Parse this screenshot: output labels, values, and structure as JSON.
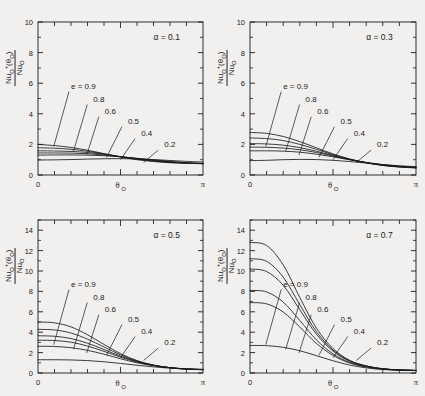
{
  "figure": {
    "caption_present": false,
    "background": "#f2f0ee",
    "ink": "#1a1a1a",
    "panel_count": 4
  },
  "axis": {
    "xlabel": "θ",
    "xlabel_sub": "O",
    "x_tick_left": "0",
    "x_tick_right": "π",
    "ylabel_num_pre": "Nu",
    "ylabel_num_sub": "O",
    "ylabel_num_sup": "+",
    "ylabel_num_arg": "(θ",
    "ylabel_num_arg_sub": "O",
    "ylabel_num_arg_post": ")",
    "ylabel_den_pre": "Nu",
    "ylabel_den_sub": "O"
  },
  "series_labels": {
    "first": "e = 0.9",
    "rest": [
      "0.8",
      "0.6",
      "0.5",
      "0.4",
      "0.2"
    ],
    "all": [
      "e = 0.9",
      "0.8",
      "0.6",
      "0.5",
      "0.4",
      "0.2"
    ],
    "e_values": [
      0.9,
      0.8,
      0.6,
      0.5,
      0.4,
      0.2
    ]
  },
  "chart_data": [
    {
      "type": "line",
      "panel": "top-left",
      "title": "α = 0.1",
      "annotation": "α = 0.1",
      "alpha": 0.1,
      "xlabel": "θO",
      "ylabel": "NuO+(θO) / NuO",
      "xlim": [
        0,
        3.14159
      ],
      "ylim": [
        0,
        10
      ],
      "xticks_major": [
        0,
        3.14159
      ],
      "xtick_labels": [
        "0",
        "π"
      ],
      "xticks_minor_count": 10,
      "yticks": [
        0,
        2,
        4,
        6,
        8,
        10
      ],
      "ytick_labels": [
        "0",
        "2",
        "4",
        "6",
        "8",
        "10"
      ],
      "grid": false,
      "legend_position": "inline-leader-lines",
      "x": [
        0.0,
        0.31416,
        0.62832,
        0.94248,
        1.25664,
        1.5708,
        1.88496,
        2.19911,
        2.51327,
        2.82743,
        3.14159
      ],
      "series": [
        {
          "name": "e = 0.9",
          "e": 0.9,
          "values": [
            2.0,
            1.92,
            1.8,
            1.62,
            1.4,
            1.18,
            1.0,
            0.88,
            0.8,
            0.76,
            0.74
          ]
        },
        {
          "name": "0.8",
          "e": 0.8,
          "values": [
            1.78,
            1.75,
            1.68,
            1.55,
            1.38,
            1.19,
            1.03,
            0.91,
            0.82,
            0.77,
            0.74
          ]
        },
        {
          "name": "0.6",
          "e": 0.6,
          "values": [
            1.58,
            1.57,
            1.54,
            1.47,
            1.35,
            1.2,
            1.06,
            0.94,
            0.84,
            0.78,
            0.74
          ]
        },
        {
          "name": "0.5",
          "e": 0.5,
          "values": [
            1.44,
            1.44,
            1.43,
            1.39,
            1.31,
            1.2,
            1.08,
            0.96,
            0.86,
            0.79,
            0.75
          ]
        },
        {
          "name": "0.4",
          "e": 0.4,
          "values": [
            1.3,
            1.31,
            1.31,
            1.3,
            1.26,
            1.19,
            1.09,
            0.99,
            0.89,
            0.81,
            0.76
          ]
        },
        {
          "name": "0.2",
          "e": 0.2,
          "values": [
            0.98,
            0.99,
            1.01,
            1.04,
            1.06,
            1.07,
            1.05,
            1.01,
            0.95,
            0.89,
            0.85
          ]
        }
      ]
    },
    {
      "type": "line",
      "panel": "top-right",
      "title": "α = 0.3",
      "annotation": "α = 0.3",
      "alpha": 0.3,
      "xlabel": "θO",
      "ylabel": "NuO+(θO) / NuO",
      "xlim": [
        0,
        3.14159
      ],
      "ylim": [
        0,
        10
      ],
      "xticks_major": [
        0,
        3.14159
      ],
      "xtick_labels": [
        "0",
        "π"
      ],
      "xticks_minor_count": 10,
      "yticks": [
        0,
        2,
        4,
        6,
        8,
        10
      ],
      "ytick_labels": [
        "0",
        "2",
        "4",
        "6",
        "8",
        "10"
      ],
      "grid": false,
      "legend_position": "inline-leader-lines",
      "x": [
        0.0,
        0.31416,
        0.62832,
        0.94248,
        1.25664,
        1.5708,
        1.88496,
        2.19911,
        2.51327,
        2.82743,
        3.14159
      ],
      "series": [
        {
          "name": "e = 0.9",
          "e": 0.9,
          "values": [
            2.78,
            2.72,
            2.52,
            2.18,
            1.78,
            1.38,
            1.05,
            0.8,
            0.62,
            0.52,
            0.46
          ]
        },
        {
          "name": "0.8",
          "e": 0.8,
          "values": [
            2.42,
            2.38,
            2.25,
            2.0,
            1.68,
            1.33,
            1.03,
            0.8,
            0.63,
            0.53,
            0.47
          ]
        },
        {
          "name": "0.6",
          "e": 0.6,
          "values": [
            2.05,
            2.03,
            1.95,
            1.79,
            1.55,
            1.28,
            1.02,
            0.81,
            0.65,
            0.54,
            0.48
          ]
        },
        {
          "name": "0.5",
          "e": 0.5,
          "values": [
            1.82,
            1.81,
            1.76,
            1.65,
            1.47,
            1.24,
            1.01,
            0.81,
            0.66,
            0.56,
            0.49
          ]
        },
        {
          "name": "0.4",
          "e": 0.4,
          "values": [
            1.58,
            1.58,
            1.56,
            1.49,
            1.36,
            1.19,
            0.99,
            0.82,
            0.68,
            0.58,
            0.51
          ]
        },
        {
          "name": "0.2",
          "e": 0.2,
          "values": [
            0.94,
            0.96,
            1.0,
            1.02,
            1.01,
            0.96,
            0.88,
            0.78,
            0.68,
            0.6,
            0.55
          ]
        }
      ]
    },
    {
      "type": "line",
      "panel": "bottom-left",
      "title": "α = 0.5",
      "annotation": "α = 0.5",
      "alpha": 0.5,
      "xlabel": "θO",
      "ylabel": "NuO+(θO) / NuO",
      "xlim": [
        0,
        3.14159
      ],
      "ylim": [
        0,
        15
      ],
      "xticks_major": [
        0,
        3.14159
      ],
      "xtick_labels": [
        "0",
        "π"
      ],
      "xticks_minor_count": 10,
      "yticks": [
        0,
        2,
        4,
        6,
        8,
        10,
        12,
        14
      ],
      "ytick_labels": [
        "0",
        "2",
        "4",
        "6",
        "8",
        "10",
        "12",
        "14"
      ],
      "grid": false,
      "legend_position": "inline-leader-lines",
      "x": [
        0.0,
        0.31416,
        0.62832,
        0.94248,
        1.25664,
        1.5708,
        1.88496,
        2.19911,
        2.51327,
        2.82743,
        3.14159
      ],
      "series": [
        {
          "name": "e = 0.9",
          "e": 0.9,
          "values": [
            5.0,
            4.92,
            4.52,
            3.75,
            2.8,
            1.9,
            1.22,
            0.78,
            0.52,
            0.38,
            0.32
          ]
        },
        {
          "name": "0.8",
          "e": 0.8,
          "values": [
            4.28,
            4.22,
            3.92,
            3.32,
            2.55,
            1.78,
            1.17,
            0.77,
            0.52,
            0.39,
            0.33
          ]
        },
        {
          "name": "0.6",
          "e": 0.6,
          "values": [
            3.65,
            3.6,
            3.38,
            2.92,
            2.3,
            1.65,
            1.12,
            0.75,
            0.52,
            0.39,
            0.33
          ]
        },
        {
          "name": "0.5",
          "e": 0.5,
          "values": [
            3.22,
            3.18,
            3.02,
            2.64,
            2.12,
            1.56,
            1.08,
            0.74,
            0.52,
            0.4,
            0.34
          ]
        },
        {
          "name": "0.4",
          "e": 0.4,
          "values": [
            2.62,
            2.6,
            2.48,
            2.22,
            1.84,
            1.4,
            1.0,
            0.71,
            0.52,
            0.4,
            0.35
          ]
        },
        {
          "name": "0.2",
          "e": 0.2,
          "values": [
            1.3,
            1.3,
            1.28,
            1.22,
            1.1,
            0.94,
            0.76,
            0.6,
            0.47,
            0.39,
            0.35
          ]
        }
      ]
    },
    {
      "type": "line",
      "panel": "bottom-right",
      "title": "α = 0.7",
      "annotation": "α = 0.7",
      "alpha": 0.7,
      "xlabel": "θO",
      "ylabel": "NuO+(θO) / NuO",
      "xlim": [
        0,
        3.14159
      ],
      "ylim": [
        0,
        15
      ],
      "xticks_major": [
        0,
        3.14159
      ],
      "xtick_labels": [
        "0",
        "π"
      ],
      "xticks_minor_count": 10,
      "yticks": [
        0,
        2,
        4,
        6,
        8,
        10,
        12,
        14
      ],
      "ytick_labels": [
        "0",
        "2",
        "4",
        "6",
        "8",
        "10",
        "12",
        "14"
      ],
      "grid": false,
      "legend_position": "inline-leader-lines",
      "x": [
        0.0,
        0.31416,
        0.62832,
        0.94248,
        1.25664,
        1.5708,
        1.88496,
        2.19911,
        2.51327,
        2.82743,
        3.14159
      ],
      "series": [
        {
          "name": "e = 0.9",
          "e": 0.9,
          "values": [
            12.8,
            12.5,
            10.6,
            7.4,
            4.4,
            2.4,
            1.25,
            0.7,
            0.42,
            0.3,
            0.25
          ]
        },
        {
          "name": "0.8",
          "e": 0.8,
          "values": [
            11.2,
            10.95,
            9.4,
            6.7,
            4.05,
            2.25,
            1.2,
            0.68,
            0.41,
            0.3,
            0.25
          ]
        },
        {
          "name": "0.6",
          "e": 0.6,
          "values": [
            10.2,
            9.95,
            8.6,
            6.2,
            3.8,
            2.15,
            1.16,
            0.66,
            0.41,
            0.3,
            0.25
          ]
        },
        {
          "name": "0.5",
          "e": 0.5,
          "values": [
            8.1,
            7.95,
            6.95,
            5.15,
            3.25,
            1.88,
            1.05,
            0.62,
            0.39,
            0.29,
            0.25
          ]
        },
        {
          "name": "0.4",
          "e": 0.4,
          "values": [
            6.9,
            6.78,
            5.98,
            4.5,
            2.9,
            1.72,
            0.98,
            0.59,
            0.38,
            0.29,
            0.25
          ]
        },
        {
          "name": "0.2",
          "e": 0.2,
          "values": [
            2.7,
            2.68,
            2.52,
            2.18,
            1.7,
            1.2,
            0.78,
            0.5,
            0.34,
            0.27,
            0.24
          ]
        }
      ]
    }
  ]
}
